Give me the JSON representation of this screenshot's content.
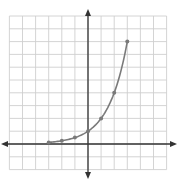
{
  "chart_data": {
    "type": "line",
    "title": "",
    "xlabel": "",
    "ylabel": "",
    "function": "y = 2^x",
    "series": [
      {
        "name": "exponential curve",
        "x": [
          -3,
          -2,
          -1,
          0,
          1,
          2,
          3
        ],
        "y": [
          0.125,
          0.25,
          0.5,
          1,
          2,
          4,
          8
        ],
        "markers": true
      }
    ],
    "xlim": [
      -6,
      6
    ],
    "ylim": [
      -2,
      10
    ],
    "grid": true,
    "grid_step": 1,
    "axes_arrows": true,
    "tick_labels": false,
    "legend": null
  },
  "style": {
    "grid_color": "#cfcfcf",
    "axis_color": "#333333",
    "curve_color": "#7a7a7a",
    "marker_color": "#7a7a7a"
  },
  "layout": {
    "origin_px": [
      88,
      144
    ],
    "unit_x_px": 13.1,
    "unit_y_px": 12.8,
    "x_axis_px": [
      1,
      177
    ],
    "y_axis_px": [
      9,
      179
    ]
  }
}
